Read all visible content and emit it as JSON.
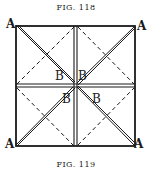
{
  "figure_top": {
    "caption": "FIG. 118"
  },
  "figure_bottom": {
    "caption": "FIG. 119"
  },
  "labels": {
    "corner_tl": "A",
    "corner_tr": "A",
    "corner_bl": "A",
    "corner_br": "A",
    "inner_tl": "B",
    "inner_tr": "B",
    "inner_bl": "B",
    "inner_br": "B"
  },
  "colors": {
    "ink": "#1a1a1a",
    "paper": "#ffffff"
  }
}
